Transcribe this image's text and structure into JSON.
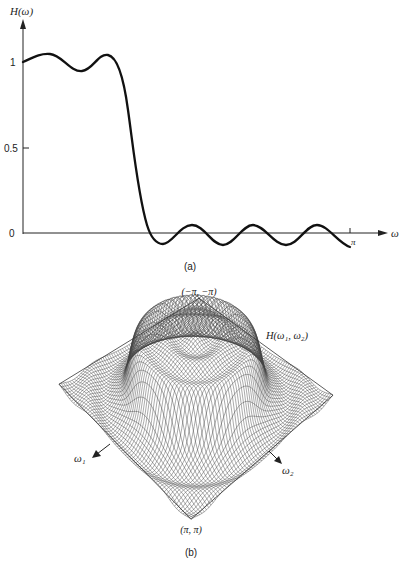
{
  "chart_data": [
    {
      "id": "a",
      "type": "line",
      "title": "",
      "caption": "(a)",
      "ylabel": "H(ω)",
      "xlabel": "ω",
      "ytick_labels": [
        "0",
        "0.5",
        "1"
      ],
      "ytick_values": [
        0,
        0.5,
        1
      ],
      "xtick_labels": [
        "π"
      ],
      "xtick_values": [
        3.1416
      ],
      "xlim": [
        0,
        3.2
      ],
      "ylim": [
        -0.1,
        1.25
      ],
      "grid": false,
      "legend": null,
      "description": "1-D lowpass filter frequency response with passband ripple near 1 and stopband ripple around 0",
      "x": [
        0,
        0.2,
        0.4,
        0.6,
        0.8,
        1.0,
        1.1,
        1.2,
        1.3,
        1.4,
        1.5,
        1.6,
        1.7,
        1.8,
        2.0,
        2.2,
        2.4,
        2.6,
        2.8,
        3.0,
        3.14
      ],
      "y": [
        1.0,
        1.04,
        1.0,
        0.94,
        1.0,
        1.04,
        1.0,
        0.78,
        0.5,
        0.22,
        0.0,
        -0.06,
        -0.02,
        0.05,
        -0.06,
        0.05,
        -0.06,
        0.05,
        -0.06,
        0.0,
        -0.08
      ]
    },
    {
      "id": "b",
      "type": "surface",
      "title": "",
      "caption": "(b)",
      "zlabel": "H(ω1, ω2)",
      "axis_labels": [
        "ω1",
        "ω2"
      ],
      "corner_labels": {
        "top": "(−π, −π)",
        "bottom": "(π, π)"
      },
      "description": "2-D circularly symmetric lowpass filter response: a cylindrical plateau of height ~1 centered in the frequency plane, surrounded by concentric ripples, shown as a wireframe mesh",
      "passband_radius": 0.35,
      "plateau_height": 1.0,
      "ripple_rings": 4
    }
  ],
  "labels": {
    "a": {
      "ylabel_main": "H",
      "ylabel_arg": "(ω)",
      "xlabel": "ω",
      "y1": "1",
      "y05": "0.5",
      "y0": "0",
      "xpi": "π",
      "caption": "(a)"
    },
    "b": {
      "top_corner": "(−π, −π)",
      "bottom_corner": "(π, π)",
      "surface_label": "H(ω₁, ω₂)",
      "w1": "ω₁",
      "w2": "ω₂",
      "caption": "(b)"
    }
  }
}
